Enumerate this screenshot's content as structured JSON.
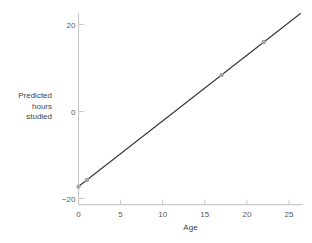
{
  "chart_data": {
    "type": "line",
    "title": "",
    "xlabel": "Age",
    "ylabel_lines": [
      "Predicted",
      "hours",
      "studied"
    ],
    "x_ticks": [
      0,
      5,
      10,
      15,
      20,
      25
    ],
    "y_ticks": [
      -20,
      0,
      20
    ],
    "xlim": [
      0,
      26.6
    ],
    "ylim": [
      -21.4,
      22.7
    ],
    "grid": false,
    "legend": "none",
    "regression_line": {
      "intercept": -17.26,
      "slope": 1.51,
      "x_start": 0,
      "x_end": 26.4
    },
    "points": [
      {
        "x": 0,
        "y": -17.26
      },
      {
        "x": 1,
        "y": -15.75
      },
      {
        "x": 17,
        "y": 8.41
      },
      {
        "x": 22,
        "y": 15.96
      }
    ],
    "colors": {
      "axis": "#c9c9c9",
      "tick_label": "#595959",
      "axis_title": "#3f3f3f",
      "line": "#3a3a3a",
      "point": "#a6a6a6"
    }
  }
}
